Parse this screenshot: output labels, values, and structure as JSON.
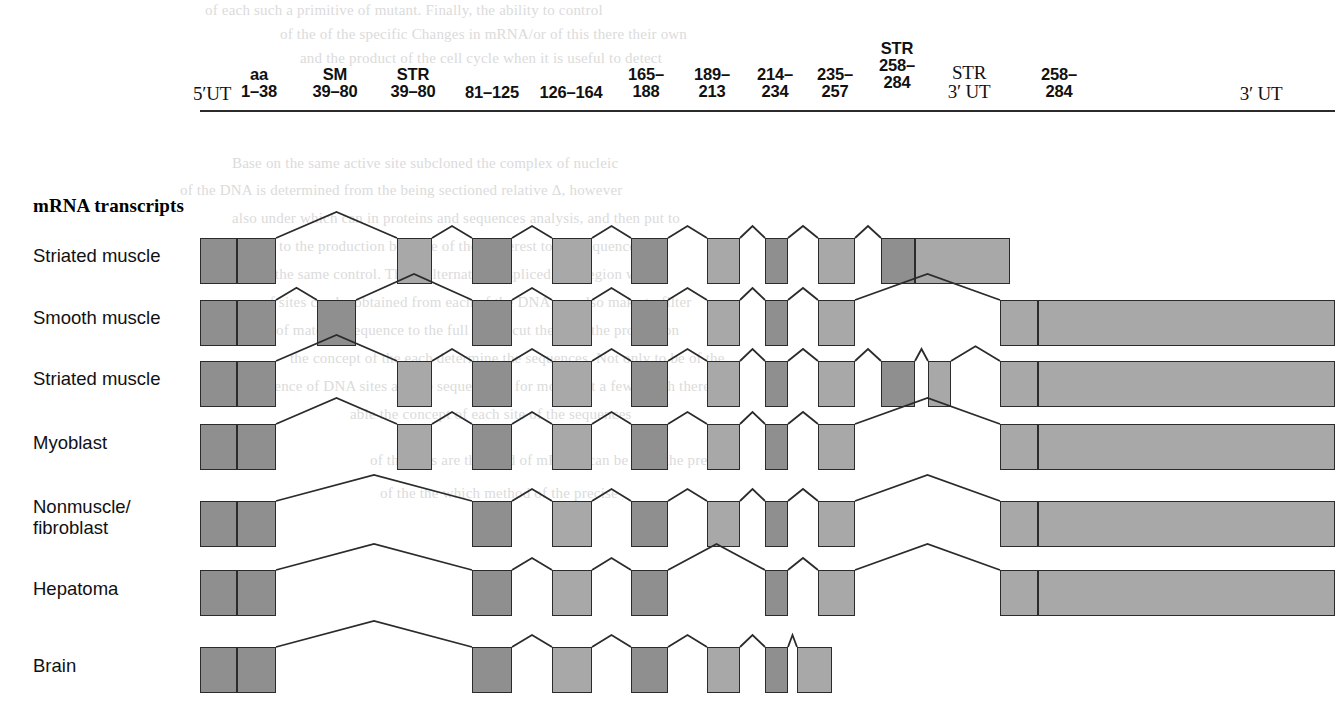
{
  "figure": {
    "kind": "alternative-splicing-diagram",
    "section_heading": "mRNA transcripts",
    "colors": {
      "exon_dark": "#8f8f8f",
      "exon_light": "#d3d3d3",
      "exon_mid": "#a8a8a8",
      "outline": "#2b2b2b",
      "background": "#ffffff",
      "ghost_text": "#cfcfcf"
    }
  },
  "gene_map": {
    "name": "gene-exon-map",
    "bar": {
      "x": 200,
      "y": 110,
      "width": 1135,
      "height": 44
    },
    "labels": [
      {
        "id": "l-5ut",
        "text": "5′UT",
        "x": 181,
        "y": 84,
        "w": 62,
        "serif": true
      },
      {
        "id": "l-aa138",
        "text": "aa\n1–38",
        "x": 233,
        "y": 66,
        "w": 52
      },
      {
        "id": "l-sm",
        "text": "SM\n39–80",
        "x": 303,
        "y": 66,
        "w": 64
      },
      {
        "id": "l-str3980",
        "text": "STR\n39–80",
        "x": 381,
        "y": 66,
        "w": 64
      },
      {
        "id": "l-81125",
        "text": "81–125",
        "x": 458,
        "y": 84,
        "w": 68
      },
      {
        "id": "l-126164",
        "text": "126–164",
        "x": 533,
        "y": 84,
        "w": 76
      },
      {
        "id": "l-165188",
        "text": "165–\n188",
        "x": 617,
        "y": 66,
        "w": 58
      },
      {
        "id": "l-189213",
        "text": "189–\n213",
        "x": 683,
        "y": 66,
        "w": 58
      },
      {
        "id": "l-214234",
        "text": "214–\n234",
        "x": 746,
        "y": 66,
        "w": 58
      },
      {
        "id": "l-235257",
        "text": "235–\n257",
        "x": 806,
        "y": 66,
        "w": 58
      },
      {
        "id": "l-str258",
        "text": "STR\n258–\n284",
        "x": 868,
        "y": 40,
        "w": 58
      },
      {
        "id": "l-str3ut",
        "text": "STR\n3′ UT",
        "x": 934,
        "y": 63,
        "w": 70,
        "serif": true
      },
      {
        "id": "l-258284b",
        "text": "258–\n284",
        "x": 1030,
        "y": 66,
        "w": 58
      },
      {
        "id": "l-3ut",
        "text": "3′ UT",
        "x": 1228,
        "y": 84,
        "w": 66,
        "serif": true
      }
    ],
    "exons": [
      {
        "id": "g-5ut",
        "name": "5'UT",
        "x": 200,
        "w": 37,
        "shade": "dark"
      },
      {
        "id": "g-aa138",
        "name": "aa 1-38",
        "x": 237,
        "w": 39,
        "shade": "dark"
      },
      {
        "id": "g-intron1",
        "name": "intron",
        "x": 276,
        "w": 41,
        "shade": "light"
      },
      {
        "id": "g-sm3980",
        "name": "SM 39-80",
        "x": 317,
        "w": 39,
        "shade": "dark"
      },
      {
        "id": "g-gap2",
        "name": "intron",
        "x": 356,
        "w": 41,
        "shade": "light"
      },
      {
        "id": "g-str3980",
        "name": "STR 39-80",
        "x": 397,
        "w": 35,
        "shade": "mid"
      },
      {
        "id": "g-gap3",
        "name": "intron",
        "x": 432,
        "w": 40,
        "shade": "light"
      },
      {
        "id": "g-81125",
        "name": "81-125",
        "x": 472,
        "w": 40,
        "shade": "dark"
      },
      {
        "id": "g-gap4",
        "name": "intron",
        "x": 512,
        "w": 40,
        "shade": "light"
      },
      {
        "id": "g-126164",
        "name": "126-164",
        "x": 552,
        "w": 40,
        "shade": "mid"
      },
      {
        "id": "g-gap5",
        "name": "intron",
        "x": 592,
        "w": 39,
        "shade": "light"
      },
      {
        "id": "g-165188",
        "name": "165-188",
        "x": 631,
        "w": 37,
        "shade": "dark"
      },
      {
        "id": "g-gap6",
        "name": "intron",
        "x": 668,
        "w": 39,
        "shade": "light"
      },
      {
        "id": "g-189213",
        "name": "189-213",
        "x": 707,
        "w": 33,
        "shade": "mid"
      },
      {
        "id": "g-gap7",
        "name": "intron",
        "x": 740,
        "w": 25,
        "shade": "light"
      },
      {
        "id": "g-214234",
        "name": "214-234",
        "x": 765,
        "w": 23,
        "shade": "dark"
      },
      {
        "id": "g-gap8",
        "name": "intron",
        "x": 788,
        "w": 30,
        "shade": "light"
      },
      {
        "id": "g-235257",
        "name": "235-257",
        "x": 818,
        "w": 37,
        "shade": "mid"
      },
      {
        "id": "g-gap9",
        "name": "intron",
        "x": 855,
        "w": 26,
        "shade": "light"
      },
      {
        "id": "g-str258",
        "name": "STR 258-284",
        "x": 881,
        "w": 34,
        "shade": "dark"
      },
      {
        "id": "g-str3ut",
        "name": "STR 3'UT",
        "x": 915,
        "w": 85,
        "shade": "mid"
      },
      {
        "id": "g-gap10",
        "name": "intron",
        "x": 1000,
        "w": 0,
        "shade": "light"
      },
      {
        "id": "g-258284b",
        "name": "258-284",
        "x": 1000,
        "w": 38,
        "shade": "mid"
      },
      {
        "id": "g-3ut",
        "name": "3'UT",
        "x": 1038,
        "w": 297,
        "shade": "mid"
      }
    ]
  },
  "transcripts": [
    {
      "id": "tx-striated-muscle-1",
      "label": "Striated muscle",
      "label_x": 33,
      "label_y": 245,
      "y": 238,
      "h": 46,
      "exons": [
        {
          "x": 200,
          "w": 37,
          "shade": "dark"
        },
        {
          "x": 237,
          "w": 39,
          "shade": "dark"
        },
        {
          "x": 397,
          "w": 35,
          "shade": "mid"
        },
        {
          "x": 472,
          "w": 40,
          "shade": "dark"
        },
        {
          "x": 552,
          "w": 40,
          "shade": "mid"
        },
        {
          "x": 631,
          "w": 37,
          "shade": "dark"
        },
        {
          "x": 707,
          "w": 33,
          "shade": "mid"
        },
        {
          "x": 765,
          "w": 23,
          "shade": "dark"
        },
        {
          "x": 818,
          "w": 37,
          "shade": "mid"
        },
        {
          "x": 881,
          "w": 34,
          "shade": "dark"
        },
        {
          "x": 915,
          "w": 95,
          "shade": "mid"
        }
      ]
    },
    {
      "id": "tx-smooth-muscle",
      "label": "Smooth muscle",
      "label_x": 33,
      "label_y": 307,
      "y": 300,
      "h": 46,
      "exons": [
        {
          "x": 200,
          "w": 37,
          "shade": "dark"
        },
        {
          "x": 237,
          "w": 39,
          "shade": "dark"
        },
        {
          "x": 317,
          "w": 39,
          "shade": "dark"
        },
        {
          "x": 472,
          "w": 40,
          "shade": "dark"
        },
        {
          "x": 552,
          "w": 40,
          "shade": "mid"
        },
        {
          "x": 631,
          "w": 37,
          "shade": "dark"
        },
        {
          "x": 707,
          "w": 33,
          "shade": "mid"
        },
        {
          "x": 765,
          "w": 23,
          "shade": "dark"
        },
        {
          "x": 818,
          "w": 37,
          "shade": "mid"
        },
        {
          "x": 1000,
          "w": 38,
          "shade": "mid"
        },
        {
          "x": 1038,
          "w": 297,
          "shade": "mid"
        }
      ]
    },
    {
      "id": "tx-striated-muscle-2",
      "label": "Striated muscle",
      "label_x": 33,
      "label_y": 368,
      "y": 361,
      "h": 46,
      "exons": [
        {
          "x": 200,
          "w": 37,
          "shade": "dark"
        },
        {
          "x": 237,
          "w": 39,
          "shade": "dark"
        },
        {
          "x": 397,
          "w": 35,
          "shade": "mid"
        },
        {
          "x": 472,
          "w": 40,
          "shade": "dark"
        },
        {
          "x": 552,
          "w": 40,
          "shade": "mid"
        },
        {
          "x": 631,
          "w": 37,
          "shade": "dark"
        },
        {
          "x": 707,
          "w": 33,
          "shade": "mid"
        },
        {
          "x": 765,
          "w": 23,
          "shade": "dark"
        },
        {
          "x": 818,
          "w": 37,
          "shade": "mid"
        },
        {
          "x": 881,
          "w": 34,
          "shade": "dark"
        },
        {
          "x": 928,
          "w": 23,
          "shade": "mid"
        },
        {
          "x": 1000,
          "w": 38,
          "shade": "mid"
        },
        {
          "x": 1038,
          "w": 297,
          "shade": "mid"
        }
      ]
    },
    {
      "id": "tx-myoblast",
      "label": "Myoblast",
      "label_x": 33,
      "label_y": 432,
      "y": 424,
      "h": 46,
      "exons": [
        {
          "x": 200,
          "w": 37,
          "shade": "dark"
        },
        {
          "x": 237,
          "w": 39,
          "shade": "dark"
        },
        {
          "x": 397,
          "w": 35,
          "shade": "mid"
        },
        {
          "x": 472,
          "w": 40,
          "shade": "dark"
        },
        {
          "x": 552,
          "w": 40,
          "shade": "mid"
        },
        {
          "x": 631,
          "w": 37,
          "shade": "dark"
        },
        {
          "x": 707,
          "w": 33,
          "shade": "mid"
        },
        {
          "x": 765,
          "w": 23,
          "shade": "dark"
        },
        {
          "x": 818,
          "w": 37,
          "shade": "mid"
        },
        {
          "x": 1000,
          "w": 38,
          "shade": "mid"
        },
        {
          "x": 1038,
          "w": 297,
          "shade": "mid"
        }
      ]
    },
    {
      "id": "tx-nonmuscle-fibroblast",
      "label": "Nonmuscle/\nfibroblast",
      "label_x": 33,
      "label_y": 496,
      "y": 501,
      "h": 46,
      "exons": [
        {
          "x": 200,
          "w": 37,
          "shade": "dark"
        },
        {
          "x": 237,
          "w": 39,
          "shade": "dark"
        },
        {
          "x": 472,
          "w": 40,
          "shade": "dark"
        },
        {
          "x": 552,
          "w": 40,
          "shade": "mid"
        },
        {
          "x": 631,
          "w": 37,
          "shade": "dark"
        },
        {
          "x": 707,
          "w": 33,
          "shade": "mid"
        },
        {
          "x": 765,
          "w": 23,
          "shade": "dark"
        },
        {
          "x": 818,
          "w": 37,
          "shade": "mid"
        },
        {
          "x": 1000,
          "w": 38,
          "shade": "mid"
        },
        {
          "x": 1038,
          "w": 297,
          "shade": "mid"
        }
      ]
    },
    {
      "id": "tx-hepatoma",
      "label": "Hepatoma",
      "label_x": 33,
      "label_y": 578,
      "y": 570,
      "h": 46,
      "exons": [
        {
          "x": 200,
          "w": 37,
          "shade": "dark"
        },
        {
          "x": 237,
          "w": 39,
          "shade": "dark"
        },
        {
          "x": 472,
          "w": 40,
          "shade": "dark"
        },
        {
          "x": 552,
          "w": 40,
          "shade": "mid"
        },
        {
          "x": 631,
          "w": 37,
          "shade": "dark"
        },
        {
          "x": 765,
          "w": 23,
          "shade": "dark"
        },
        {
          "x": 818,
          "w": 37,
          "shade": "mid"
        },
        {
          "x": 1000,
          "w": 38,
          "shade": "mid"
        },
        {
          "x": 1038,
          "w": 297,
          "shade": "mid"
        }
      ]
    },
    {
      "id": "tx-brain",
      "label": "Brain",
      "label_x": 33,
      "label_y": 655,
      "y": 647,
      "h": 46,
      "exons": [
        {
          "x": 200,
          "w": 37,
          "shade": "dark"
        },
        {
          "x": 237,
          "w": 39,
          "shade": "dark"
        },
        {
          "x": 472,
          "w": 40,
          "shade": "dark"
        },
        {
          "x": 552,
          "w": 40,
          "shade": "mid"
        },
        {
          "x": 631,
          "w": 37,
          "shade": "dark"
        },
        {
          "x": 707,
          "w": 33,
          "shade": "mid"
        },
        {
          "x": 765,
          "w": 23,
          "shade": "dark"
        },
        {
          "x": 797,
          "w": 35,
          "shade": "mid"
        }
      ]
    }
  ],
  "ghost_text": [
    {
      "text": "of each such a primitive of mutant. Finally, the ability to control",
      "x": 205,
      "y": 2,
      "size": 15
    },
    {
      "text": "of the of the specific Changes in mRNA/or of this there their own",
      "x": 280,
      "y": 26,
      "size": 15
    },
    {
      "text": "and the product of the cell cycle when it is useful to detect",
      "x": 300,
      "y": 50,
      "size": 15
    },
    {
      "text": "Base on the same active site subcloned the complex of nucleic",
      "x": 232,
      "y": 155,
      "size": 15
    },
    {
      "text": "of the DNA is determined from the being sectioned relative Δ, however",
      "x": 180,
      "y": 182,
      "size": 15
    },
    {
      "text": "also under which can in proteins and sequences analysis, and then put to",
      "x": 232,
      "y": 210,
      "size": 15
    },
    {
      "text": "prior to the production because of their interest to the sequence",
      "x": 245,
      "y": 238,
      "size": 15
    },
    {
      "text": "of the same control. These alternatively spliced of a region within",
      "x": 258,
      "y": 266,
      "size": 15
    },
    {
      "text": "of sites can be obtained from each of the DNA can also make to filter",
      "x": 262,
      "y": 294,
      "size": 15
    },
    {
      "text": "of material sequence to the full of the cut the gene the proportion",
      "x": 276,
      "y": 322,
      "size": 15
    },
    {
      "text": "the concept of the each determine the sequences. Not only to be of the",
      "x": 290,
      "y": 350,
      "size": 15
    },
    {
      "text": "sequence of DNA sites are the sequencing; for more that a few which there to",
      "x": 246,
      "y": 378,
      "size": 15
    },
    {
      "text": "able the concept of each site of the sequences",
      "x": 350,
      "y": 406,
      "size": 15
    },
    {
      "text": "of the sites are the field of mRNA, can be after the precise",
      "x": 370,
      "y": 452,
      "size": 15
    },
    {
      "text": "of the the which method of the precise",
      "x": 380,
      "y": 485,
      "size": 15
    }
  ]
}
